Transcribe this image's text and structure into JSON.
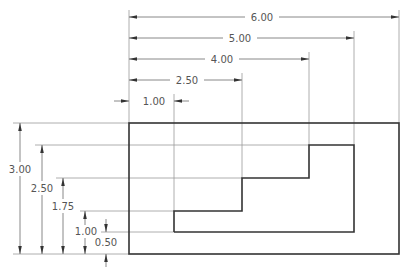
{
  "drawing": {
    "units_per_px_scale": 45,
    "colors": {
      "object_line": "#333333",
      "dimension_line": "#6a6a6a",
      "extension_line": "#9a9a9a",
      "text": "#555555"
    },
    "outer_rectangle": {
      "width": 6.0,
      "height": 3.0
    },
    "inner_profile": {
      "points": [
        [
          1.0,
          0.5
        ],
        [
          5.0,
          0.5
        ],
        [
          5.0,
          2.5
        ],
        [
          4.0,
          2.5
        ],
        [
          4.0,
          1.75
        ],
        [
          2.5,
          1.75
        ],
        [
          2.5,
          1.0
        ],
        [
          1.0,
          1.0
        ]
      ]
    },
    "horizontal_dimensions": [
      {
        "label": "6.00",
        "value": 6.0
      },
      {
        "label": "5.00",
        "value": 5.0
      },
      {
        "label": "4.00",
        "value": 4.0
      },
      {
        "label": "2.50",
        "value": 2.5
      },
      {
        "label": "1.00",
        "value": 1.0
      }
    ],
    "vertical_dimensions": [
      {
        "label": "3.00",
        "value": 3.0
      },
      {
        "label": "2.50",
        "value": 2.5
      },
      {
        "label": "1.75",
        "value": 1.75
      },
      {
        "label": "1.00",
        "value": 1.0
      },
      {
        "label": "0.50",
        "value": 0.5
      }
    ]
  }
}
